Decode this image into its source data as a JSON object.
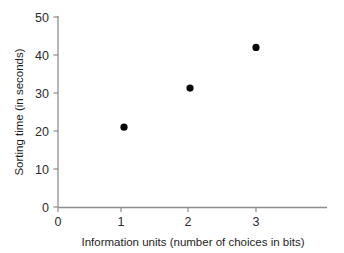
{
  "chart_data": {
    "type": "scatter",
    "title": "",
    "subtitle": "",
    "xlabel": "Information units (number of choices in bits)",
    "ylabel": "Sorting time (in seconds)",
    "x": [
      1,
      2,
      3
    ],
    "values": [
      21,
      31.3,
      42
    ],
    "series": [
      {
        "name": "Sorting time",
        "x": [
          1,
          2,
          3
        ],
        "values": [
          21,
          31.3,
          42
        ]
      }
    ],
    "xlim": [
      0,
      3.95
    ],
    "ylim": [
      0,
      50
    ],
    "xticks": [
      0,
      1,
      2,
      3
    ],
    "yticks": [
      0,
      10,
      20,
      30,
      40,
      50
    ],
    "xtick_labels": [
      "0",
      "1",
      "2",
      "3"
    ],
    "ytick_labels": [
      "0",
      "10",
      "20",
      "30",
      "40",
      "50"
    ],
    "grid": false,
    "legend": false,
    "legend_position": "none",
    "marker": "filled-circle",
    "marker_color": "#080808",
    "axis_color": "#8d8d8d",
    "background_color": "#ffffff"
  },
  "axes": {
    "y_axis_title": "Sorting time (in seconds)",
    "x_axis_title": "Information units (number of choices in bits)",
    "y_tick_0": "0",
    "y_tick_1": "10",
    "y_tick_2": "20",
    "y_tick_3": "30",
    "y_tick_4": "40",
    "y_tick_5": "50",
    "x_tick_0": "0",
    "x_tick_1": "1",
    "x_tick_2": "2",
    "x_tick_3": "3"
  }
}
